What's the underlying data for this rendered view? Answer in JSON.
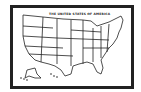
{
  "map": {
    "title": "THE UNITED STATES OF AMERICA",
    "style": "black outline line drawing",
    "colors": {
      "line": "#222222",
      "background": "#ffffff"
    },
    "regions": [
      "contiguous-us",
      "alaska",
      "hawaii"
    ]
  }
}
